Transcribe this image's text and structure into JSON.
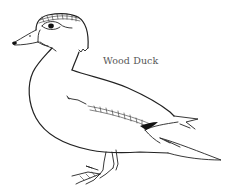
{
  "illustration": {
    "subject": "wood-duck-line-drawing",
    "label": "Wood Duck",
    "colors": {
      "line": "#222222",
      "label": "#555555",
      "background": "#ffffff"
    }
  }
}
